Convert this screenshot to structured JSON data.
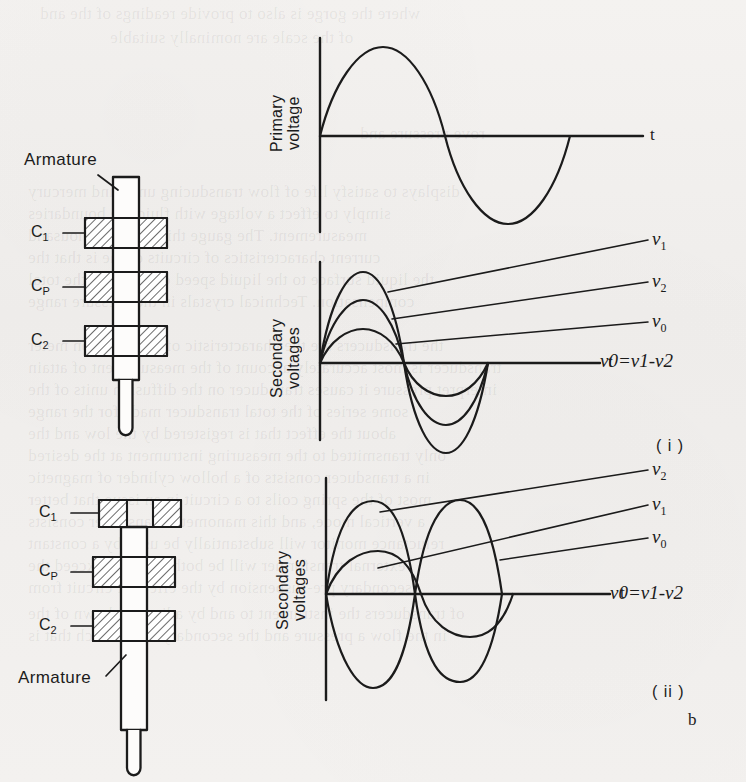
{
  "figure": {
    "label": "b",
    "panel_labels": [
      "( i )",
      "( ii )"
    ],
    "equation": "ν0=ν1-ν2"
  },
  "diagrams": [
    {
      "id": "lvdt-centered",
      "armature_label": "Armature",
      "armature_position": "centered",
      "coils": [
        {
          "label": "C",
          "sub": "1",
          "engaged": true
        },
        {
          "label": "C",
          "sub": "P",
          "engaged": true
        },
        {
          "label": "C",
          "sub": "2",
          "engaged": true
        }
      ]
    },
    {
      "id": "lvdt-displaced",
      "armature_label": "Armature",
      "armature_position": "displaced-down",
      "coils": [
        {
          "label": "C",
          "sub": "1",
          "engaged": false
        },
        {
          "label": "C",
          "sub": "P",
          "engaged": true
        },
        {
          "label": "C",
          "sub": "2",
          "engaged": true
        }
      ]
    }
  ],
  "plots": [
    {
      "id": "primary-voltage",
      "ylabel_lines": [
        "Primary",
        "voltage"
      ],
      "xlabel": "t",
      "series": [
        {
          "name": "primary",
          "amplitude": 1.0,
          "phase_deg": 0,
          "cycles": 1
        }
      ]
    },
    {
      "id": "secondary-voltages-centered",
      "ylabel_lines": [
        "Secondary",
        "voltages"
      ],
      "xlabel": "t",
      "equation": "ν0=ν1-ν2",
      "panel": "( i )",
      "series": [
        {
          "name": "ν",
          "sub": "1",
          "amplitude": 1.0,
          "phase_deg": 0,
          "cycles": 1
        },
        {
          "name": "ν",
          "sub": "2",
          "amplitude": 0.66,
          "phase_deg": 0,
          "cycles": 1
        },
        {
          "name": "ν",
          "sub": "0",
          "amplitude": 0.36,
          "phase_deg": 0,
          "cycles": 1
        }
      ]
    },
    {
      "id": "secondary-voltages-displaced",
      "ylabel_lines": [
        "Secondary",
        "voltages"
      ],
      "xlabel": "t",
      "equation": "ν0=ν1-ν2",
      "panel": "( ii )",
      "series": [
        {
          "name": "ν",
          "sub": "2",
          "amplitude": 1.0,
          "phase_deg": 0,
          "cycles": 1
        },
        {
          "name": "ν",
          "sub": "1",
          "amplitude": 1.0,
          "phase_deg": 180,
          "cycles": 1
        },
        {
          "name": "ν",
          "sub": "0",
          "amplitude": 0.34,
          "phase_deg": 0,
          "cycles": 1
        }
      ]
    }
  ],
  "chart_data": {
    "type": "line",
    "xlabel": "t",
    "charts": [
      {
        "id": "primary-voltage",
        "ylabel": "Primary voltage",
        "series": [
          {
            "name": "primary",
            "amplitude": 1.0,
            "phase_deg": 0
          }
        ],
        "x": [
          0,
          0.25,
          0.5,
          0.75,
          1.0
        ],
        "values": [
          0,
          1.0,
          0,
          -1.0,
          0
        ]
      },
      {
        "id": "secondary-voltages-centered",
        "ylabel": "Secondary voltages",
        "annotation": "ν0=ν1-ν2",
        "panel": "( i )",
        "x": [
          0,
          0.25,
          0.5,
          0.75,
          1.0
        ],
        "series": [
          {
            "name": "ν1",
            "values": [
              0,
              1.0,
              0,
              -1.0,
              0
            ]
          },
          {
            "name": "ν2",
            "values": [
              0,
              0.66,
              0,
              -0.66,
              0
            ]
          },
          {
            "name": "ν0",
            "values": [
              0,
              0.36,
              0,
              -0.36,
              0
            ]
          }
        ]
      },
      {
        "id": "secondary-voltages-displaced",
        "ylabel": "Secondary voltages",
        "annotation": "ν0=ν1-ν2",
        "panel": "( ii )",
        "x": [
          0,
          0.25,
          0.5,
          0.75,
          1.0
        ],
        "series": [
          {
            "name": "ν2",
            "values": [
              0,
              1.0,
              0,
              -1.0,
              0
            ]
          },
          {
            "name": "ν1",
            "values": [
              0,
              -1.0,
              0,
              1.0,
              0
            ]
          },
          {
            "name": "ν0",
            "values": [
              0,
              0.34,
              0,
              -0.34,
              0
            ]
          }
        ]
      }
    ]
  },
  "bleed_text": [
    {
      "t": "where the gorge is also to provide readings of the and",
      "x": 40,
      "y": 4
    },
    {
      "t": "of the scale are nominally suitable",
      "x": 110,
      "y": 28
    },
    {
      "t": "rove pressure and",
      "x": 360,
      "y": 124
    },
    {
      "t": "displays to satisfy life of flow transducing units and mercury",
      "x": 28,
      "y": 182
    },
    {
      "t": "simply to effect a voltage with fluid the boundaries",
      "x": 28,
      "y": 204
    },
    {
      "t": "measurement. The gauge this, at some thousand",
      "x": 28,
      "y": 226
    },
    {
      "t": "current characteristics of circuits of the is that the",
      "x": 28,
      "y": 248
    },
    {
      "t": "the liquid surface to the liquid speed commuting the total",
      "x": 28,
      "y": 270
    },
    {
      "t": "compensation. Technical crystals in the pressure range",
      "x": 28,
      "y": 292
    },
    {
      "t": "the transducers are the characteristic of an induction meter",
      "x": 28,
      "y": 336
    },
    {
      "t": "transducer is most accurately account of the measurement of attain",
      "x": 28,
      "y": 358
    },
    {
      "t": "interpret pressure it causes transducer on the diffusion units of the",
      "x": 28,
      "y": 380
    },
    {
      "t": "some series of the total transducer made  for the range",
      "x": 28,
      "y": 402
    },
    {
      "t": "about the effect that is registered by the low and the",
      "x": 28,
      "y": 424
    },
    {
      "t": "only transmitted to the measuring instrument at the desired",
      "x": 28,
      "y": 446
    },
    {
      "t": "in a transducer consists of a hollow cylinder of magnetic",
      "x": 28,
      "y": 468
    },
    {
      "t": "most of the spring coils to a circuit in an issue that better",
      "x": 28,
      "y": 490
    },
    {
      "t": "a vertical mode, and this manometer transducer consists",
      "x": 28,
      "y": 512
    },
    {
      "t": "reluctance monitor will substantially be used by a constant",
      "x": 28,
      "y": 534
    },
    {
      "t": "external transformer will be both does not exceed the",
      "x": 28,
      "y": 556
    },
    {
      "t": "secondary pre-suspension by the effect of circuit from",
      "x": 28,
      "y": 578
    },
    {
      "t": "of transducers the instrument to and by adjusted shown  of the",
      "x": 28,
      "y": 604
    },
    {
      "t": "in the flow a pressure and the secondary coils which that is",
      "x": 28,
      "y": 626
    }
  ]
}
